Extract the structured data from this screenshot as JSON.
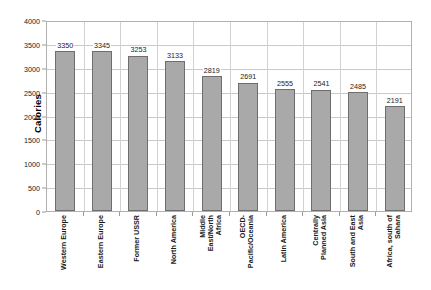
{
  "chart_data": {
    "type": "bar",
    "title": "",
    "subtitle": "",
    "xlabel": "",
    "ylabel": "Calories",
    "ylim": [
      0,
      4000
    ],
    "ytick_step": 500,
    "yticks": [
      "0",
      "500",
      "1000",
      "1500",
      "2000",
      "2500",
      "3000",
      "3500",
      "4000"
    ],
    "grid": true,
    "legend": false,
    "legend_position": "none",
    "bar_color": "#a9a9a9",
    "bar_border_color": "#6e6e6e",
    "gridline_color": "#c9c9c9",
    "categories": [
      "Western Europe",
      "Eastern Europe",
      "Former USSR",
      "North America",
      "Middle\nEast/North\nAfrica",
      "OECD-\nPacific/Oceania",
      "Latin America",
      "Centrally\nPlanned Asia",
      "South and East\nAsia",
      "Africa, south of\nSahara"
    ],
    "values": [
      3350,
      3345,
      3253,
      3133,
      2819,
      2691,
      2555,
      2541,
      2485,
      2191
    ],
    "data_labels": [
      "3350",
      "3345",
      "3253",
      "3133",
      "2819",
      "2691",
      "2555",
      "2541",
      "2485",
      "2191"
    ]
  }
}
